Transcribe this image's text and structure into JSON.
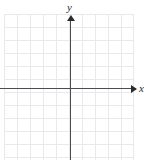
{
  "figure": {
    "type": "cartesian-grid",
    "width": 149,
    "height": 160,
    "background_color": "#ffffff"
  },
  "axes": {
    "x": {
      "label": "x",
      "color": "#4c4c50",
      "arrow": "right",
      "arrow_color": "#2b2b2e"
    },
    "y": {
      "label": "y",
      "color": "#4c4c50",
      "arrow": "up",
      "arrow_color": "#2b2b2e"
    },
    "origin": {
      "x": 70,
      "y": 88
    }
  },
  "grid": {
    "line_color": "#e9e9ec",
    "cell_size": 13,
    "columns": 10,
    "rows": 11,
    "left": 4,
    "top": 14,
    "width": 130,
    "height": 146,
    "visible": true
  },
  "chart_data": {
    "type": "scatter",
    "title": "",
    "subtitle": "",
    "xlabel": "x",
    "ylabel": "y",
    "series": [],
    "x": [],
    "values": [],
    "xticklabels": [],
    "yticklabels": [],
    "xlim": [
      -5.1,
      4.9
    ],
    "ylim": [
      -5.5,
      5.6
    ],
    "grid": true,
    "legend": null,
    "annotations": []
  }
}
